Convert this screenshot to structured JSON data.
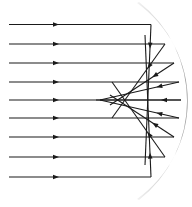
{
  "diagram": {
    "title": "Spherical aberration in a concave mirror",
    "mirror": {
      "type": "concave-spherical",
      "top": [
        137,
        3
      ],
      "bottom": [
        137,
        199
      ],
      "radius": 120,
      "thickness": 6,
      "color_light": "#f2f2f2",
      "color_dark": "#9a9a9a"
    },
    "ray_color": "#1a1a1a",
    "ray_width": 1.1,
    "start_x": 9,
    "incident_arrow_x": 56,
    "focal_cusp": [
      96,
      100
    ],
    "rays": [
      {
        "y": 24.5,
        "hit_x": 151,
        "end": [
          145,
          165
        ],
        "arrow_t": 0.15
      },
      {
        "y": 44,
        "hit_x": 165,
        "end": [
          112,
          118
        ],
        "arrow_t": 0.3
      },
      {
        "y": 63,
        "hit_x": 174,
        "end": [
          110,
          105
        ],
        "arrow_t": 0.3
      },
      {
        "y": 82,
        "hit_x": 179,
        "end": [
          100,
          100
        ],
        "arrow_t": 0.25
      },
      {
        "y": 100,
        "hit_x": 181,
        "end": [
          96,
          100
        ],
        "arrow_t": 0.2
      },
      {
        "y": 118,
        "hit_x": 179,
        "end": [
          100,
          100
        ],
        "arrow_t": 0.25
      },
      {
        "y": 137,
        "hit_x": 174,
        "end": [
          110,
          95
        ],
        "arrow_t": 0.3
      },
      {
        "y": 157,
        "hit_x": 165,
        "end": [
          112,
          82
        ],
        "arrow_t": 0.3
      },
      {
        "y": 177,
        "hit_x": 151,
        "end": [
          145,
          35
        ],
        "arrow_t": 0.15
      }
    ]
  }
}
